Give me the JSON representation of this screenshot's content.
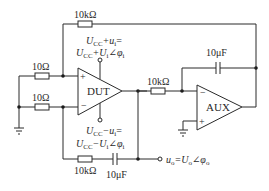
{
  "diagram": {
    "type": "circuit",
    "components": {
      "dut": {
        "label": "DUT",
        "plus": "+",
        "minus": "−"
      },
      "aux": {
        "label": "AUX",
        "plus": "+",
        "minus": "−"
      },
      "r_in_top": {
        "label": "10Ω"
      },
      "r_in_bottom": {
        "label": "10Ω"
      },
      "r_feedback_top": {
        "label": "10kΩ"
      },
      "r_aux_in": {
        "label": "10kΩ"
      },
      "r_feedback_bottom": {
        "label": "10kΩ"
      },
      "c_aux": {
        "label": "10μF"
      },
      "c_bottom": {
        "label": "10μF"
      }
    },
    "annotations": {
      "supply_pos_line1": "U",
      "supply_pos_line1_sub": "CC",
      "supply_pos_line1_rest": "+u",
      "supply_pos_line1_sub2": "i",
      "supply_pos_line1_eq": "=",
      "supply_pos_line2": "U",
      "supply_pos_line2_sub": "CC",
      "supply_pos_line2_rest": "+U",
      "supply_pos_line2_sub2": "i",
      "supply_pos_line2_angle": "∠φ",
      "supply_pos_line2_sub3": "i",
      "supply_neg_line1": "U",
      "supply_neg_line1_sub": "CC",
      "supply_neg_line1_rest": "−u",
      "supply_neg_line1_sub2": "i",
      "supply_neg_line1_eq": "=",
      "supply_neg_line2": "U",
      "supply_neg_line2_sub": "CC",
      "supply_neg_line2_rest": "−U",
      "supply_neg_line2_sub2": "i",
      "supply_neg_line2_angle": "∠φ",
      "supply_neg_line2_sub3": "i",
      "output_u": "u",
      "output_u_sub": "o",
      "output_eq": "=U",
      "output_U_sub": "o",
      "output_angle": "∠φ",
      "output_phi_sub": "o"
    }
  }
}
